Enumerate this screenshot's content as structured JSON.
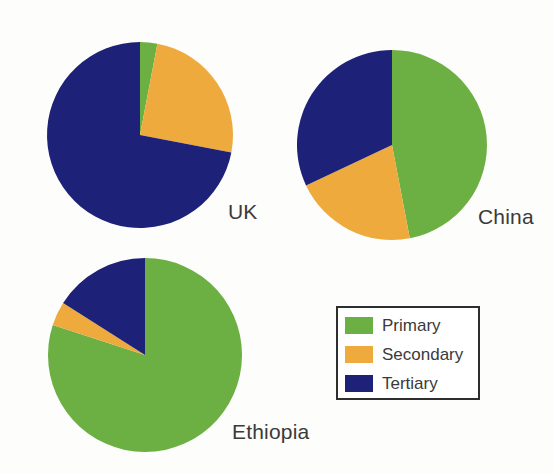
{
  "figure": {
    "background_color": "#fdfdfb",
    "label_color": "#3a3a3a"
  },
  "colors": {
    "primary": "#6cb043",
    "secondary": "#eeaa3c",
    "tertiary": "#1d2178",
    "legend_border": "#2e2e2e",
    "legend_background": "#ffffff"
  },
  "legend": {
    "position": "bottom-right",
    "items": [
      {
        "label": "Primary",
        "color": "#6cb043",
        "swatch_name": "legend-swatch-primary"
      },
      {
        "label": "Secondary",
        "color": "#eeaa3c",
        "swatch_name": "legend-swatch-secondary"
      },
      {
        "label": "Tertiary",
        "color": "#1d2178",
        "swatch_name": "legend-swatch-tertiary"
      }
    ]
  },
  "charts": [
    {
      "id": "uk",
      "label": "UK",
      "label_x": 228,
      "label_y": 201,
      "center_x": 140,
      "center_y": 135,
      "radius": 93,
      "values": [
        3,
        25,
        72
      ]
    },
    {
      "id": "china",
      "label": "China",
      "label_x": 478,
      "label_y": 206,
      "center_x": 392,
      "center_y": 145,
      "radius": 95,
      "values": [
        47,
        21,
        32
      ]
    },
    {
      "id": "ethiopia",
      "label": "Ethiopia",
      "label_x": 232,
      "label_y": 421,
      "center_x": 145,
      "center_y": 355,
      "radius": 97,
      "values": [
        80,
        4,
        16
      ]
    }
  ],
  "chart_data": {
    "type": "pie",
    "title": "",
    "subtitle": "",
    "xlabel": "",
    "ylabel": "",
    "grid": false,
    "legend_position": "bottom-right",
    "legend_entries": [
      "Primary",
      "Secondary",
      "Tertiary"
    ],
    "slice_colors": [
      "#6cb043",
      "#eeaa3c",
      "#1d2178"
    ],
    "units": "percent",
    "start_angle_deg": 0,
    "direction": "clockwise",
    "panels": [
      {
        "name": "UK",
        "labels": [
          "Primary",
          "Secondary",
          "Tertiary"
        ],
        "values": [
          3,
          25,
          72
        ]
      },
      {
        "name": "China",
        "labels": [
          "Primary",
          "Secondary",
          "Tertiary"
        ],
        "values": [
          47,
          21,
          32
        ]
      },
      {
        "name": "Ethiopia",
        "labels": [
          "Primary",
          "Secondary",
          "Tertiary"
        ],
        "values": [
          80,
          4,
          16
        ]
      }
    ]
  }
}
